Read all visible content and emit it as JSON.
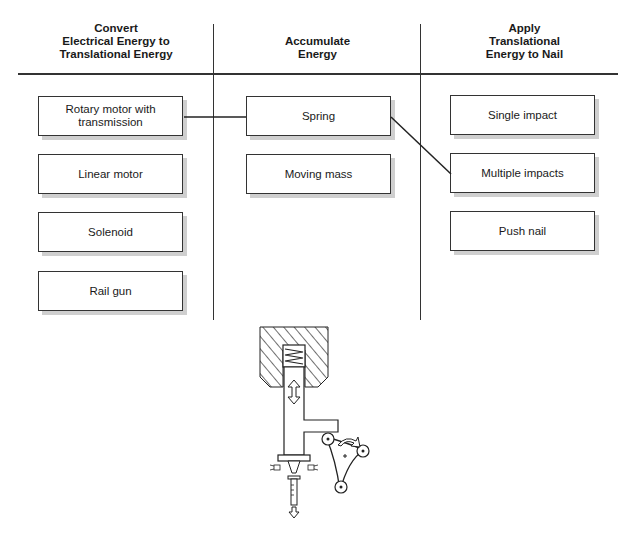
{
  "columns": [
    {
      "header": "Convert\nElectrical Energy to\nTranslational Energy",
      "options": [
        "Rotary motor with\ntransmission",
        "Linear motor",
        "Solenoid",
        "Rail gun"
      ]
    },
    {
      "header": "Accumulate\nEnergy",
      "options": [
        "Spring",
        "Moving mass"
      ]
    },
    {
      "header": "Apply\nTranslational\nEnergy to Nail",
      "options": [
        "Single impact",
        "Multiple impacts",
        "Push nail"
      ]
    }
  ],
  "selected_path": [
    "Rotary motor with transmission",
    "Spring",
    "Multiple impacts"
  ],
  "illustration": "spring-loaded-hammer-with-rotating-cam-mechanism"
}
